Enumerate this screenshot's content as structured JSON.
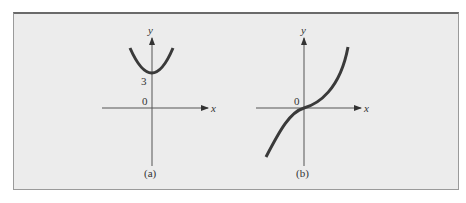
{
  "figure": {
    "panels": [
      {
        "caption": "(a)",
        "x_axis_label": "x",
        "y_axis_label": "y",
        "origin_label": "0",
        "y_intercept_label": "3",
        "curve": "parabola opening upward with minimum at (0, 3)"
      },
      {
        "caption": "(b)",
        "x_axis_label": "x",
        "y_axis_label": "y",
        "origin_label": "0",
        "curve": "increasing cubic-like curve through origin"
      }
    ]
  },
  "colors": {
    "background": "#ececec",
    "curve": "#3a3a3a",
    "axis": "#555555"
  }
}
